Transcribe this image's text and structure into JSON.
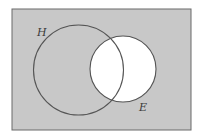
{
  "diagram": {
    "type": "venn",
    "universe": {
      "x": 12,
      "y": 9,
      "width": 179,
      "height": 121,
      "fill": "#c8c8c8",
      "stroke": "#6a6a6a"
    },
    "sets": [
      {
        "label": "H",
        "cx": 78.5,
        "cy": 70,
        "r": 45,
        "shaded": true,
        "label_x": 37,
        "label_y": 36
      },
      {
        "label": "E",
        "cx": 123,
        "cy": 69,
        "r": 33,
        "shaded": false,
        "label_x": 139,
        "label_y": 111
      }
    ],
    "shading_note": "Region shaded: complement of E (everything outside E is gray)",
    "colors": {
      "shade": "#c8c8c8",
      "unshaded": "#ffffff",
      "outline": "#555555"
    }
  }
}
